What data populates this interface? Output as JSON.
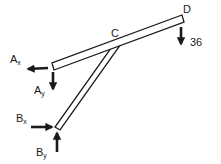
{
  "diagram": {
    "type": "free-body-diagram",
    "points": {
      "C": {
        "label": "C"
      },
      "D": {
        "label": "D"
      }
    },
    "loads": {
      "D_force": {
        "value": "36",
        "direction": "down"
      }
    },
    "reactions": {
      "Ax": {
        "main": "A",
        "sub": "x",
        "direction": "left"
      },
      "Ay": {
        "main": "A",
        "sub": "y",
        "direction": "down"
      },
      "Bx": {
        "main": "B",
        "sub": "x",
        "direction": "right"
      },
      "By": {
        "main": "B",
        "sub": "y",
        "direction": "up"
      }
    },
    "members": [
      {
        "name": "AD",
        "from": "A",
        "to": "D"
      },
      {
        "name": "BC",
        "from": "B",
        "to": "C"
      }
    ],
    "colors": {
      "stroke": "#1a1a1a",
      "fill": "#ffffff"
    }
  }
}
